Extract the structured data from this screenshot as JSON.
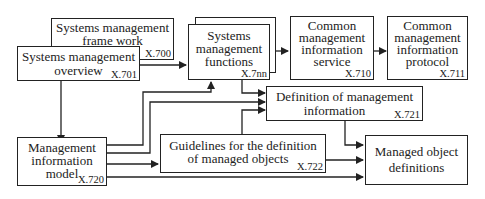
{
  "diagram": {
    "nodes": {
      "framework": {
        "lines": [
          "Systems management",
          "frame work"
        ],
        "code": "X.700"
      },
      "overview": {
        "lines": [
          "Systems management",
          "overview"
        ],
        "code": "X.701"
      },
      "functions": {
        "lines": [
          "Systems",
          "management",
          "functions"
        ],
        "code": "X.7nn"
      },
      "cmis": {
        "lines": [
          "Common",
          "management",
          "information",
          "service"
        ],
        "code": "X.710"
      },
      "cmip": {
        "lines": [
          "Common",
          "management",
          "information",
          "protocol"
        ],
        "code": "X.711"
      },
      "dmi": {
        "lines": [
          "Definition of management",
          "information"
        ],
        "code": "X.721"
      },
      "mim": {
        "lines": [
          "Management",
          "information",
          "model"
        ],
        "code": "X.720"
      },
      "gdmo": {
        "lines": [
          "Guidelines for the definition",
          "of managed objects"
        ],
        "code": "X.722"
      },
      "mod": {
        "lines": [
          "Managed object",
          "definitions"
        ],
        "code": ""
      }
    },
    "edges": [
      {
        "from": "overview",
        "to": "functions"
      },
      {
        "from": "functions",
        "to": "cmis"
      },
      {
        "from": "cmis",
        "to": "cmip"
      },
      {
        "from": "functions",
        "to": "dmi"
      },
      {
        "from": "overview",
        "to": "mim"
      },
      {
        "from": "mim",
        "to": "functions"
      },
      {
        "from": "mim",
        "to": "dmi"
      },
      {
        "from": "mim",
        "to": "gdmo"
      },
      {
        "from": "gdmo",
        "to": "dmi"
      },
      {
        "from": "dmi",
        "to": "mod"
      },
      {
        "from": "gdmo",
        "to": "mod"
      },
      {
        "from": "mim",
        "to": "mod"
      }
    ]
  }
}
